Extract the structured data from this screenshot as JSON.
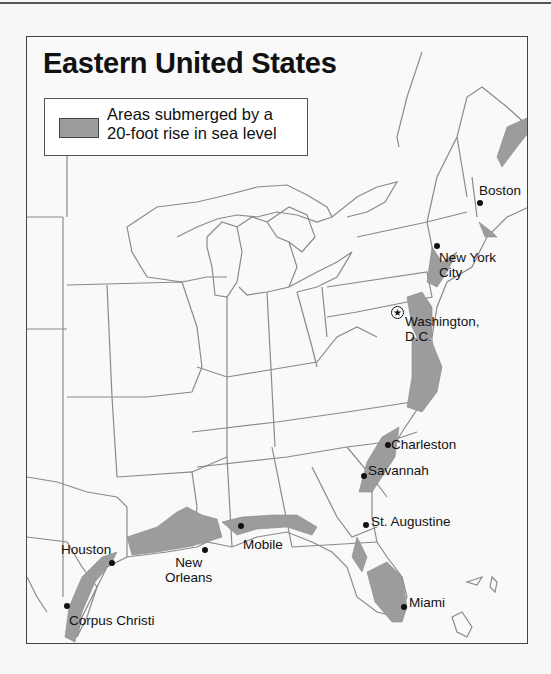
{
  "map": {
    "title": "Eastern United States",
    "legend": {
      "swatch_color": "#9c9c9c",
      "line1": "Areas submerged by a",
      "line2": "20-foot rise in sea level"
    },
    "colors": {
      "background": "#f9f9f9",
      "state_border": "#8a8a8a",
      "submerged": "#9c9c9c",
      "text": "#111111"
    },
    "cities": [
      {
        "name": "Boston",
        "label": "Boston",
        "type": "city"
      },
      {
        "name": "New York City",
        "label1": "New York",
        "label2": "City",
        "type": "city"
      },
      {
        "name": "Washington, D.C.",
        "label1": "Washington,",
        "label2": "D.C.",
        "type": "capital",
        "capital_symbol": "★"
      },
      {
        "name": "Charleston",
        "label": "Charleston",
        "type": "city"
      },
      {
        "name": "Savannah",
        "label": "Savannah",
        "type": "city"
      },
      {
        "name": "St. Augustine",
        "label": "St. Augustine",
        "type": "city"
      },
      {
        "name": "Miami",
        "label": "Miami",
        "type": "city"
      },
      {
        "name": "Mobile",
        "label": "Mobile",
        "type": "city"
      },
      {
        "name": "New Orleans",
        "label1": "New",
        "label2": "Orleans",
        "type": "city"
      },
      {
        "name": "Houston",
        "label": "Houston",
        "type": "city"
      },
      {
        "name": "Corpus Christi",
        "label": "Corpus Christi",
        "type": "city"
      }
    ]
  }
}
